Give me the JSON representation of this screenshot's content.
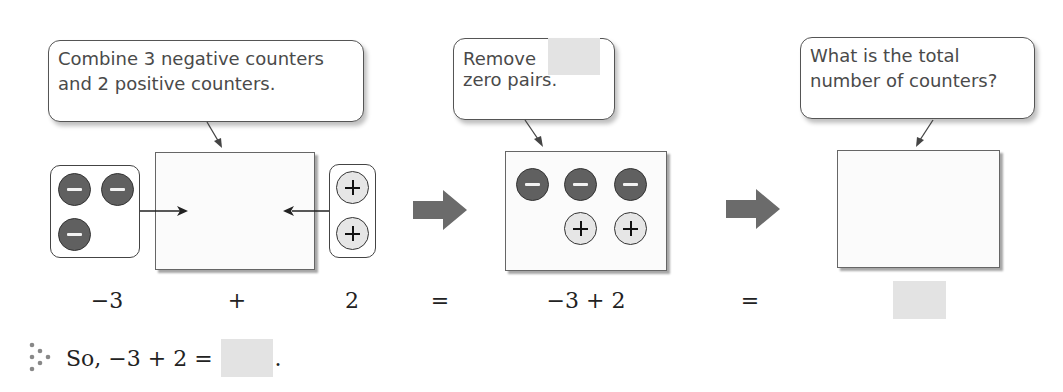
{
  "callouts": {
    "step1": {
      "line1": "Combine 3 negative counters",
      "line2": "and 2 positive counters."
    },
    "step2": {
      "line1": "Remove",
      "line2": "zero pairs.",
      "blank": ""
    },
    "step3": {
      "line1": "What is the total",
      "line2": "number of counters?"
    }
  },
  "step1": {
    "negative_counters": 3,
    "positive_counters": 2
  },
  "step2": {
    "negative_counters": 3,
    "positive_counters": 2
  },
  "equation": {
    "term1": "−3",
    "op1": "+",
    "term2": "2",
    "eq1": "=",
    "expr": "−3 + 2",
    "eq2": "=",
    "answer_blank": ""
  },
  "conclusion": {
    "icon": "triple-dot-therefore-icon",
    "text": "So, −3 + 2 =",
    "answer_blank": "",
    "end": "."
  },
  "colors": {
    "negative_counter": "#606060",
    "positive_counter": "#e6e6e6",
    "arrow": "#6b6b6b",
    "blank": "#e3e3e3"
  }
}
